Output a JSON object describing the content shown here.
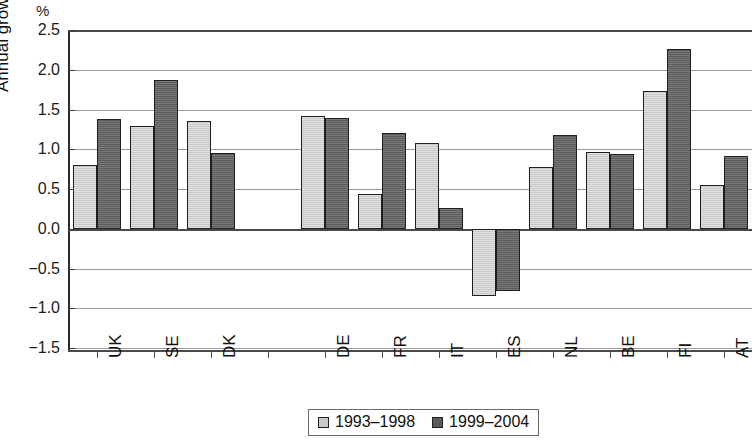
{
  "chart_data": {
    "type": "bar",
    "title": "",
    "xlabel": "",
    "ylabel": "Annual growth",
    "unit_label": "%",
    "ylim": [
      -1.5,
      2.5
    ],
    "ytick_step": 0.5,
    "grid": true,
    "legend_position": "bottom",
    "categories": [
      "UK",
      "SE",
      "DK",
      "",
      "DE",
      "FR",
      "IT",
      "ES",
      "NL",
      "BE",
      "FI",
      "AT"
    ],
    "series": [
      {
        "name": "1993–1998",
        "color": "#c9c9c9",
        "values": [
          0.8,
          1.29,
          1.35,
          null,
          1.42,
          0.44,
          1.08,
          -0.84,
          0.78,
          0.97,
          1.73,
          0.55
        ]
      },
      {
        "name": "1999–2004",
        "color": "#5b5b5b",
        "values": [
          1.38,
          1.87,
          0.95,
          null,
          1.39,
          1.2,
          0.26,
          -0.78,
          1.18,
          0.94,
          2.26,
          0.91
        ]
      }
    ],
    "ytick_labels": [
      "2.5",
      "2.0",
      "1.5",
      "1.0",
      "0.5",
      "0.0",
      "−0.5",
      "−1.0",
      "−1.5"
    ],
    "ytick_values": [
      2.5,
      2.0,
      1.5,
      1.0,
      0.5,
      0.0,
      -0.5,
      -1.0,
      -1.5
    ]
  }
}
